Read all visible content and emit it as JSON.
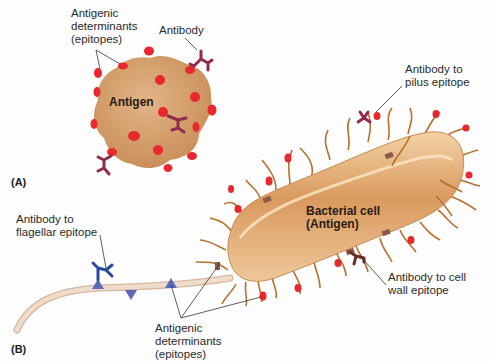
{
  "figure": {
    "panels": [
      {
        "id": "A",
        "label": "(A)"
      },
      {
        "id": "B",
        "label": "(B)"
      }
    ],
    "panel_a": {
      "antigen_label": "Antigen",
      "epitopes_label_line1": "Antigenic",
      "epitopes_label_line2": "determinants",
      "epitopes_label_line3": "(epitopes)",
      "antibody_label": "Antibody"
    },
    "panel_b": {
      "cell_label_line1": "Bacterial cell",
      "cell_label_line2": "(Antigen)",
      "pilus_label_line1": "Antibody to",
      "pilus_label_line2": "pilus epitope",
      "flagellar_label_line1": "Antibody to",
      "flagellar_label_line2": "flagellar epitope",
      "cellwall_label_line1": "Antibody to cell",
      "cellwall_label_line2": "wall epitope",
      "epitopes_label_line1": "Antigenic",
      "epitopes_label_line2": "determinants",
      "epitopes_label_line3": "(epitopes)"
    },
    "colors": {
      "antigen_body": "#d9a46e",
      "epitope_red": "#e8282e",
      "antibody_maroon": "#8e2b4e",
      "flagellar_antibody_blue": "#2c4aa0",
      "bacterial_body": "#e0ad76",
      "pili": "#b8702e",
      "flagellum": "#ead2bf",
      "cellwall_antibody": "#6b2a22"
    }
  }
}
